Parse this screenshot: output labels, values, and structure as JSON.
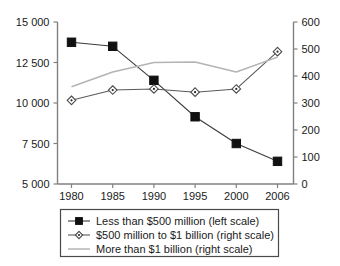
{
  "chart_data": {
    "type": "line",
    "title": "",
    "subtitle": "",
    "xlabel": "",
    "ylabel": "",
    "grid": false,
    "legend_position": "bottom",
    "categories": [
      "1980",
      "1985",
      "1990",
      "1995",
      "2000",
      "2006"
    ],
    "x_tick_labels": [
      "1980",
      "1985",
      "1990",
      "1995",
      "2000",
      "2006"
    ],
    "left_axis": {
      "label": "",
      "ylim": [
        5000,
        15000
      ],
      "ticks": [
        5000,
        7500,
        10000,
        12500,
        15000
      ],
      "tick_labels": [
        "5 000",
        "7 500",
        "10 000",
        "12 500",
        "15 000"
      ]
    },
    "right_axis": {
      "label": "",
      "ylim": [
        0,
        600
      ],
      "ticks": [
        0,
        100,
        200,
        300,
        400,
        500,
        600
      ],
      "tick_labels": [
        "0",
        "100",
        "200",
        "300",
        "400",
        "500",
        "600"
      ]
    },
    "series": [
      {
        "name": "Less than $500 million (left scale)",
        "axis": "left",
        "marker": "filled-square",
        "color": "#3a3a3a",
        "values": [
          13750,
          13500,
          11400,
          9150,
          7500,
          6400
        ]
      },
      {
        "name": "$500 million to $1 billion (right scale)",
        "axis": "right",
        "marker": "open-diamond",
        "color": "#5a5a5a",
        "values": [
          310,
          348,
          352,
          340,
          352,
          490
        ]
      },
      {
        "name": "More than $1 billion (right scale)",
        "axis": "right",
        "marker": "none",
        "color": "#b4b4b4",
        "values": [
          360,
          415,
          450,
          452,
          415,
          470
        ]
      }
    ]
  },
  "legend": {
    "items": [
      {
        "label": "Less than $500 million (left scale)"
      },
      {
        "label": "$500 million to $1 billion (right scale)"
      },
      {
        "label": "More than $1 billion (right scale)"
      }
    ]
  }
}
